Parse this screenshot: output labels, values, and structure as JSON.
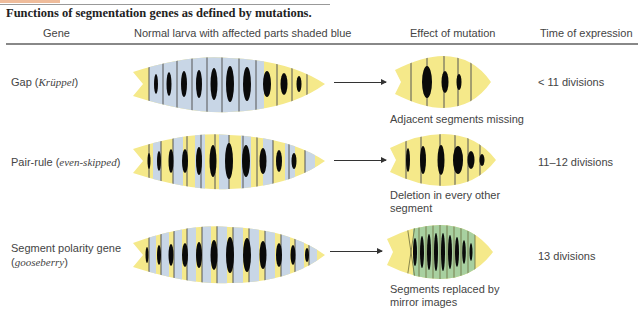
{
  "figure": {
    "title": "Functions of segmentation genes as defined by mutations.",
    "columns": [
      "Gene",
      "Normal larva with affected parts shaded blue",
      "Effect of mutation",
      "Time of expression"
    ],
    "rows": [
      {
        "gene_name": "Gap",
        "gene_example": "Krüppel",
        "effect": "Adjacent segments missing",
        "effect_line2": "",
        "time": "< 11 divisions",
        "shading": "contiguous block of anterior/middle segments shaded blue"
      },
      {
        "gene_name": "Pair-rule",
        "gene_example": "even-skipped",
        "effect": "Deletion in every other",
        "effect_line2": "segment",
        "time": "11–12 divisions",
        "shading": "alternating segments shaded blue"
      },
      {
        "gene_name": "Segment polarity gene",
        "gene_example": "gooseberry",
        "effect": "Segments replaced by",
        "effect_line2": "mirror images",
        "time": "13 divisions",
        "shading": "part of every segment shaded blue"
      }
    ],
    "colors": {
      "larva_yellow": "#f5e98a",
      "affected_blue": "#c8d6e6",
      "denticle_black": "#0a0a0a",
      "mirror_green": "#a8d0a0",
      "rule_gray": "#888888"
    }
  }
}
